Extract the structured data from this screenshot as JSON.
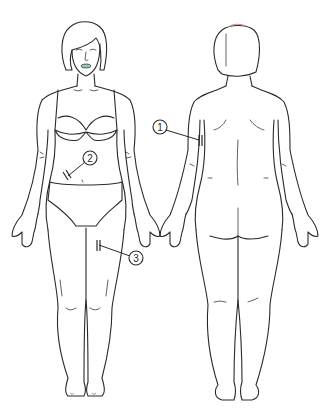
{
  "figure": {
    "views": [
      {
        "id": "front",
        "label": "front view of female body"
      },
      {
        "id": "back",
        "label": "back view of female body"
      }
    ],
    "callouts": [
      {
        "number": "1",
        "site": "upper arm (back view)",
        "marker": "||"
      },
      {
        "number": "2",
        "site": "abdomen (front view)",
        "marker": "||"
      },
      {
        "number": "3",
        "site": "thigh (front view)",
        "marker": "||"
      }
    ],
    "colors": {
      "line": "#2a2a2a",
      "background": "#ffffff",
      "lips_tint": "#9cc9b4",
      "toe_tint": "#7fbf6a",
      "hair_tint": "#d98080"
    }
  }
}
